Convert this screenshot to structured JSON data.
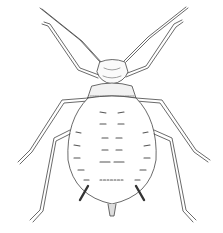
{
  "image": {
    "subject": "Aphid line drawing illustration",
    "view": "dorsal",
    "style": "black ink line art on white",
    "colors": {
      "background": "#ffffff",
      "ink": "#333333",
      "shade": "#777777"
    }
  },
  "caption": ""
}
